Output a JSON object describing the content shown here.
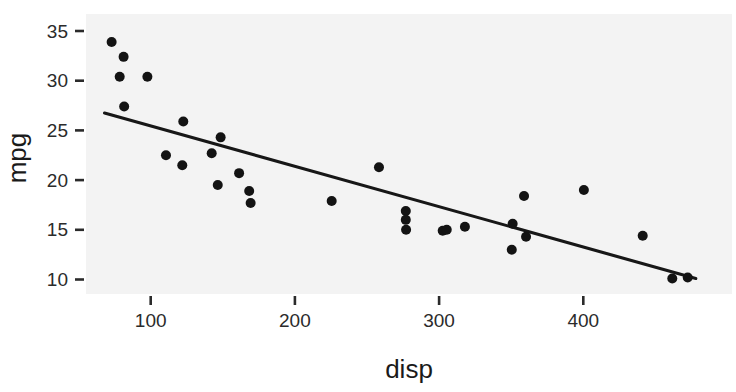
{
  "chart_data": {
    "type": "scatter",
    "title": "",
    "subtitle": "",
    "xlabel": "disp",
    "ylabel": "mpg",
    "xlim": [
      60,
      500
    ],
    "ylim": [
      8.5,
      36.5
    ],
    "xticks": [
      100,
      200,
      300,
      400
    ],
    "yticks": [
      10,
      15,
      20,
      25,
      30,
      35
    ],
    "xtick_labels": [
      "100",
      "200",
      "300",
      "400"
    ],
    "ytick_labels": [
      "10",
      "15",
      "20",
      "25",
      "30",
      "35"
    ],
    "grid": false,
    "legend": "none",
    "point_color": "#131313",
    "line_color": "#171717",
    "panel_color": "#f3f3f3",
    "series": [
      {
        "name": "mtcars",
        "marker": "filled-circle",
        "x": [
          72.9,
          81.2,
          78.5,
          97.7,
          81.6,
          122.6,
          148.5,
          110.6,
          142.3,
          121.9,
          161.3,
          146.5,
          168.3,
          169.3,
          225.5,
          258.3,
          276.9,
          276.9,
          277.1,
          302.5,
          305.3,
          317.9,
          351.0,
          358.9,
          360.3,
          350.4,
          400.4,
          441.2,
          461.7,
          472.4
        ],
        "y": [
          33.9,
          32.4,
          30.4,
          30.4,
          27.4,
          25.9,
          24.3,
          22.5,
          22.7,
          21.5,
          20.7,
          19.5,
          18.9,
          17.7,
          17.9,
          21.3,
          16.9,
          16.0,
          15.0,
          14.9,
          15.0,
          15.3,
          15.6,
          18.4,
          14.3,
          13.0,
          19.0,
          14.4,
          10.1,
          10.2
        ]
      }
    ],
    "fit_line": {
      "name": "linear-regression",
      "x": [
        68.0,
        478.0
      ],
      "y": [
        26.75,
        10.1
      ]
    }
  },
  "axes": {
    "x_title": "disp",
    "y_title": "mpg"
  }
}
